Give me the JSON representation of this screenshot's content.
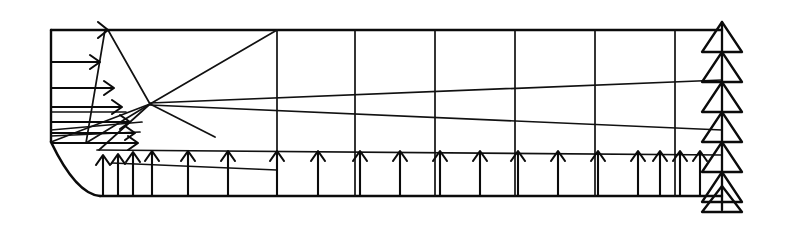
{
  "figure": {
    "name": "axisymmetric-nozzle-mesh",
    "width": 796,
    "height": 225,
    "background_color": "#ffffff",
    "line_color": "#0b0b0b"
  },
  "domain": {
    "top_wall": {
      "y": 30,
      "x_start": 51,
      "x_end": 722
    },
    "bottom_wall": {
      "y": 196,
      "x_start": 100,
      "x_end": 722
    },
    "inlet_edge": {
      "x": 51,
      "y_top": 30,
      "y_bottom": 142
    },
    "outlet_edge": {
      "x": 722,
      "y_top": 22,
      "y_bottom": 205
    },
    "contraction_curve": {
      "description": "concave rounded corner joining inlet bottom to bottom wall",
      "start_x": 51,
      "start_y": 142,
      "control_x": 72,
      "control_y": 192,
      "end_x": 100,
      "end_y": 196
    }
  },
  "grid": {
    "vertical_line_x": [
      277,
      355,
      435,
      515,
      595,
      675,
      722
    ],
    "horizontal_line_y": [
      30,
      80,
      130,
      155,
      196
    ],
    "structured_region_x_start": 277,
    "structured_region_x_end": 722
  },
  "transition_mesh": {
    "description": "unstructured fan of quadrilateral cells near the contraction",
    "polylines": [
      [
        [
          51,
          30
        ],
        [
          105,
          30
        ]
      ],
      [
        [
          105,
          30
        ],
        [
          86,
          142
        ]
      ],
      [
        [
          105,
          30
        ],
        [
          150,
          105
        ]
      ],
      [
        [
          150,
          105
        ],
        [
          277,
          30
        ]
      ],
      [
        [
          150,
          105
        ],
        [
          97,
          148
        ]
      ],
      [
        [
          51,
          62
        ],
        [
          95,
          62
        ]
      ],
      [
        [
          51,
          88
        ],
        [
          112,
          88
        ]
      ],
      [
        [
          51,
          112
        ],
        [
          128,
          112
        ]
      ],
      [
        [
          51,
          130
        ],
        [
          142,
          124
        ]
      ],
      [
        [
          51,
          142
        ],
        [
          150,
          105
        ]
      ],
      [
        [
          86,
          142
        ],
        [
          150,
          105
        ]
      ],
      [
        [
          277,
          30
        ],
        [
          277,
          196
        ]
      ],
      [
        [
          150,
          105
        ],
        [
          277,
          130
        ]
      ],
      [
        [
          97,
          148
        ],
        [
          277,
          155
        ]
      ],
      [
        [
          112,
          160
        ],
        [
          277,
          168
        ]
      ],
      [
        [
          118,
          196
        ],
        [
          118,
          162
        ]
      ],
      [
        [
          133,
          196
        ],
        [
          133,
          160
        ]
      ],
      [
        [
          150,
          196
        ],
        [
          150,
          158
        ]
      ]
    ]
  },
  "inflow_arrows": {
    "name": "inlet-velocity-profile-arrows",
    "direction": "right",
    "count": 7,
    "items": [
      {
        "y": 30,
        "x_start": 51,
        "x_end": 107
      },
      {
        "y": 62,
        "x_start": 51,
        "x_end": 98
      },
      {
        "y": 88,
        "x_start": 51,
        "x_end": 112
      },
      {
        "y": 107,
        "x_start": 51,
        "x_end": 120
      },
      {
        "y": 122,
        "x_start": 51,
        "x_end": 128
      },
      {
        "y": 133,
        "x_start": 51,
        "x_end": 133
      },
      {
        "y": 142,
        "x_start": 51,
        "x_end": 136
      }
    ]
  },
  "bottom_arrows": {
    "name": "symmetry-axis-arrows",
    "direction": "up",
    "count": 20,
    "x_positions": [
      103,
      118,
      133,
      152,
      188,
      228,
      277,
      318,
      360,
      400,
      440,
      480,
      518,
      558,
      598,
      638,
      660,
      680,
      700,
      716
    ],
    "base_y": 196,
    "tip_y": 152
  },
  "outflow_arrows": {
    "name": "outlet-pressure-triangles",
    "direction": "up",
    "count": 7,
    "x": 722,
    "triangle_half_width": 20,
    "triangle_height": 30,
    "tip_y_positions": [
      22,
      52,
      82,
      112,
      142,
      172,
      200
    ]
  },
  "legend": {
    "inflow_label": "",
    "outflow_label": "",
    "symmetry_label": ""
  }
}
